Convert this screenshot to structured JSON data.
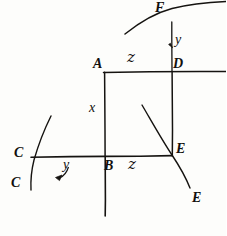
{
  "figure": {
    "kind": "hand-drawn-geometric-diagram",
    "title": "",
    "ink_color": "#151310",
    "background_color": "#fdfdfb",
    "width": 226,
    "height": 236,
    "labels": [
      {
        "id": "F",
        "text": "F",
        "x": 158,
        "y": 3,
        "style": "cap",
        "note": "upper curve label"
      },
      {
        "id": "y1",
        "text": "y",
        "x": 174,
        "y": 38,
        "style": "low",
        "note": "vertical distance above D"
      },
      {
        "id": "A",
        "text": "A",
        "x": 96,
        "y": 60,
        "style": "cap",
        "note": "top-left corner"
      },
      {
        "id": "z1",
        "text": "z",
        "x": 128,
        "y": 55,
        "style": "z",
        "note": "top side length"
      },
      {
        "id": "D",
        "text": "D",
        "x": 172,
        "y": 60,
        "style": "cap",
        "note": "top-right corner"
      },
      {
        "id": "x",
        "text": "x",
        "x": 89,
        "y": 105,
        "style": "low",
        "note": "left side length"
      },
      {
        "id": "C1",
        "text": "C",
        "x": 15,
        "y": 148,
        "style": "cap",
        "note": "left curve upper label"
      },
      {
        "id": "y2",
        "text": "y",
        "x": 60,
        "y": 163,
        "style": "low",
        "note": "horizontal distance left of B"
      },
      {
        "id": "B",
        "text": "B",
        "x": 104,
        "y": 160,
        "style": "cap",
        "note": "bottom-left corner"
      },
      {
        "id": "z2",
        "text": "z",
        "x": 128,
        "y": 158,
        "style": "z",
        "note": "bottom side length"
      },
      {
        "id": "E1",
        "text": "E",
        "x": 176,
        "y": 144,
        "style": "cap",
        "note": "bottom-right corner"
      },
      {
        "id": "C2",
        "text": "C",
        "x": 12,
        "y": 178,
        "style": "cap",
        "note": "left curve lower label"
      },
      {
        "id": "E2",
        "text": "E",
        "x": 191,
        "y": 193,
        "style": "cap",
        "note": "right curve lower label"
      }
    ],
    "rectangle": {
      "name": "ABED",
      "top_left": {
        "x": 104,
        "y": 72
      },
      "top_right": {
        "x": 172,
        "y": 72
      },
      "bottom_right": {
        "x": 172,
        "y": 156
      },
      "bottom_left": {
        "x": 104,
        "y": 156
      }
    },
    "axes": [
      {
        "name": "horizontal-line-through-A-D",
        "x1": 104,
        "y1": 72,
        "x2": 226,
        "y2": 72
      },
      {
        "name": "horizontal-line-through-C-B-E",
        "x1": 32,
        "y1": 156,
        "x2": 172,
        "y2": 156
      },
      {
        "name": "vertical-line-through-B",
        "x1": 105,
        "y1": 156,
        "x2": 105,
        "y2": 216
      },
      {
        "name": "vertical-line-through-D",
        "x1": 172,
        "y1": 20,
        "x2": 172,
        "y2": 72
      }
    ],
    "curves": [
      {
        "name": "upper-curve-F",
        "note": "concave arc crossing vertical at F"
      },
      {
        "name": "left-curve-C",
        "note": "arc crossing horizontal at C"
      },
      {
        "name": "right-curve-E",
        "note": "arc crossing corner E"
      }
    ],
    "arrows": [
      {
        "name": "arrow-y-down",
        "note": "small down arrow at y above D"
      },
      {
        "name": "arrow-y-left",
        "note": "small left arrow under y at bottom-left"
      }
    ]
  }
}
